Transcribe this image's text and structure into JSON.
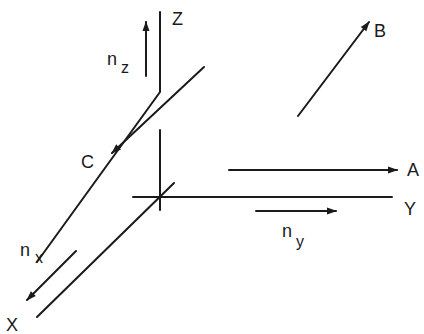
{
  "diagram": {
    "stroke_color": "#1a1a1a",
    "background": "#ffffff",
    "axes": {
      "z": {
        "label": "Z"
      },
      "y": {
        "label": "Y"
      },
      "x": {
        "label": "X"
      }
    },
    "vectors": {
      "A": {
        "label": "A",
        "direction": "parallel to Y axis"
      },
      "B": {
        "label": "B",
        "direction": "up-right, out of plane"
      },
      "C": {
        "label": "C",
        "direction": "along bent line toward X"
      }
    },
    "unit_vectors": {
      "nz": {
        "base": "n",
        "sub": "z"
      },
      "ny": {
        "base": "n",
        "sub": "y"
      },
      "nx": {
        "base": "n",
        "sub": "x"
      }
    }
  }
}
